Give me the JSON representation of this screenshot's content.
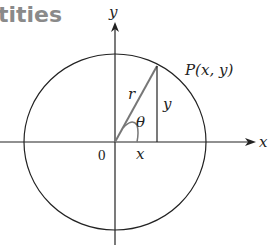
{
  "heading": {
    "text": "tities"
  },
  "diagram": {
    "axes": {
      "x_label": "x",
      "y_label": "y"
    },
    "origin_label": "0",
    "point_label": "P(x, y)",
    "radius_label": "r",
    "opposite_label": "y",
    "adjacent_label": "x",
    "angle_label": "θ",
    "colors": {
      "line": "#222222",
      "radius": "#777777",
      "heading": "#8a8a8a"
    }
  }
}
